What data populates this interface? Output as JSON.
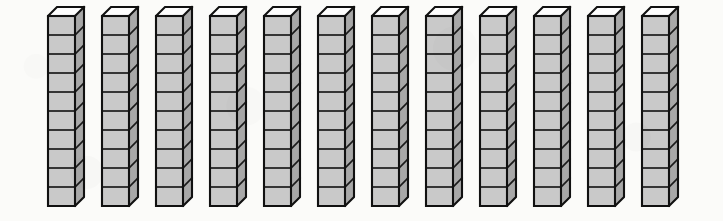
{
  "illustration": {
    "title": "Base-ten rods",
    "subject": "base-ten-blocks",
    "alt_text": "Twelve base-ten rods, each made of ten stacked unit cubes",
    "rod_count": 12,
    "cubes_per_rod": 10,
    "total_units": 120,
    "projection": "isometric",
    "has_labels": false,
    "has_axes": false
  },
  "colors": {
    "background": "#fbfbf9",
    "cube_front": "#c9c9c9",
    "cube_top": "#fdfdfd",
    "cube_side": "#a8a8a8",
    "outline": "#111111"
  },
  "geometry": {
    "stage_width": 723,
    "stage_height": 221,
    "rod_pitch": 54,
    "first_rod_left": 45,
    "rod_top": 13,
    "face_width": 27,
    "cube_height": 19,
    "depth_x": 9,
    "depth_y": 9
  },
  "chart_data": {
    "type": "bar",
    "xlabel": "",
    "ylabel": "",
    "categories": [
      "rod-1",
      "rod-2",
      "rod-3",
      "rod-4",
      "rod-5",
      "rod-6",
      "rod-7",
      "rod-8",
      "rod-9",
      "rod-10",
      "rod-11",
      "rod-12"
    ],
    "values": [
      10,
      10,
      10,
      10,
      10,
      10,
      10,
      10,
      10,
      10,
      10,
      10
    ],
    "ylim": [
      0,
      10
    ],
    "grid": false,
    "legend": false,
    "unit": "unit cubes",
    "total": 120
  },
  "rods": [
    {
      "id": "rod-1",
      "index": 1,
      "cubes": 10,
      "left": 45
    },
    {
      "id": "rod-2",
      "index": 2,
      "cubes": 10,
      "left": 99
    },
    {
      "id": "rod-3",
      "index": 3,
      "cubes": 10,
      "left": 153
    },
    {
      "id": "rod-4",
      "index": 4,
      "cubes": 10,
      "left": 207
    },
    {
      "id": "rod-5",
      "index": 5,
      "cubes": 10,
      "left": 261
    },
    {
      "id": "rod-6",
      "index": 6,
      "cubes": 10,
      "left": 315
    },
    {
      "id": "rod-7",
      "index": 7,
      "cubes": 10,
      "left": 369
    },
    {
      "id": "rod-8",
      "index": 8,
      "cubes": 10,
      "left": 423
    },
    {
      "id": "rod-9",
      "index": 9,
      "cubes": 10,
      "left": 477
    },
    {
      "id": "rod-10",
      "index": 10,
      "cubes": 10,
      "left": 531
    },
    {
      "id": "rod-11",
      "index": 11,
      "cubes": 10,
      "left": 585
    },
    {
      "id": "rod-12",
      "index": 12,
      "cubes": 10,
      "left": 639
    }
  ]
}
